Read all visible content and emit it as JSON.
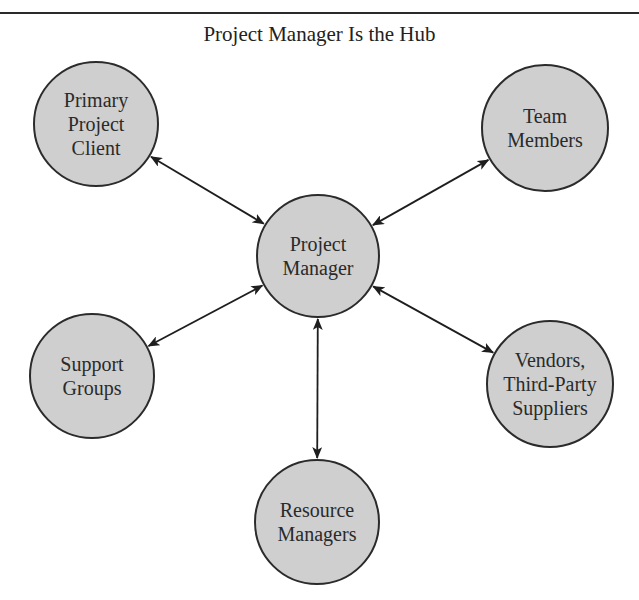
{
  "title": "Project Manager Is the Hub",
  "hub": {
    "id": "project-manager",
    "label": "Project\nManager",
    "cx": 318,
    "cy": 256,
    "r": 62
  },
  "nodes": [
    {
      "id": "primary-project-client",
      "label": "Primary\nProject\nClient",
      "cx": 96,
      "cy": 124,
      "r": 63
    },
    {
      "id": "team-members",
      "label": "Team\nMembers",
      "cx": 545,
      "cy": 128,
      "r": 64
    },
    {
      "id": "support-groups",
      "label": "Support\nGroups",
      "cx": 92,
      "cy": 376,
      "r": 63
    },
    {
      "id": "vendors-third-party-suppliers",
      "label": "Vendors,\nThird-Party\nSuppliers",
      "cx": 550,
      "cy": 384,
      "r": 64
    },
    {
      "id": "resource-managers",
      "label": "Resource\nManagers",
      "cx": 317,
      "cy": 522,
      "r": 63
    }
  ],
  "edges": [
    {
      "from": "project-manager",
      "to": "primary-project-client",
      "bidirectional": true
    },
    {
      "from": "project-manager",
      "to": "team-members",
      "bidirectional": true
    },
    {
      "from": "project-manager",
      "to": "support-groups",
      "bidirectional": true
    },
    {
      "from": "project-manager",
      "to": "vendors-third-party-suppliers",
      "bidirectional": true
    },
    {
      "from": "project-manager",
      "to": "resource-managers",
      "bidirectional": true
    }
  ],
  "colors": {
    "node_fill": "#cfcfcf",
    "stroke": "#2b2b2b",
    "text": "#2a2a2a"
  }
}
